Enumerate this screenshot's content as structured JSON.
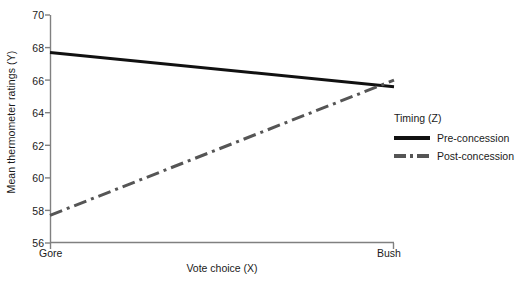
{
  "chart_data": {
    "type": "line",
    "title": "",
    "xlabel": "Vote choice (X)",
    "ylabel": "Mean thermometer ratings (Y)",
    "categories": [
      "Gore",
      "Bush"
    ],
    "xticklabels": [
      "Gore",
      "Bush"
    ],
    "yticks": [
      56,
      58,
      60,
      62,
      64,
      66,
      68,
      70
    ],
    "yticklabels": [
      "56",
      "58",
      "60",
      "62",
      "64",
      "66",
      "68",
      "70"
    ],
    "ylim": [
      56,
      70
    ],
    "xlim": [
      0,
      1
    ],
    "grid": false,
    "legend": {
      "title": "Timing (Z)",
      "position": "right",
      "entries": [
        {
          "name": "Pre-concession",
          "style": "solid",
          "color": "#111111"
        },
        {
          "name": "Post-concession",
          "style": "dashdot",
          "color": "#555555"
        }
      ]
    },
    "series": [
      {
        "name": "Pre-concession",
        "style": "solid",
        "color": "#111111",
        "x": [
          "Gore",
          "Bush"
        ],
        "values": [
          67.7,
          65.6
        ]
      },
      {
        "name": "Post-concession",
        "style": "dashdot",
        "color": "#555555",
        "x": [
          "Gore",
          "Bush"
        ],
        "values": [
          57.7,
          66.0
        ]
      }
    ]
  },
  "axes": {
    "y_title": "Mean thermometer ratings (Y)",
    "x_title": "Vote choice (X)",
    "y_tick_0": "56",
    "y_tick_1": "58",
    "y_tick_2": "60",
    "y_tick_3": "62",
    "y_tick_4": "64",
    "y_tick_5": "66",
    "y_tick_6": "68",
    "y_tick_7": "70",
    "x_tick_left": "Gore",
    "x_tick_right": "Bush"
  },
  "legend": {
    "title": "Timing (Z)",
    "entry_0": "Pre-concession",
    "entry_1": "Post-concession"
  },
  "colors": {
    "background": "#ffffff",
    "axis": "#808080",
    "series_pre": "#111111",
    "series_post": "#555555",
    "text": "#1a1a1a"
  }
}
